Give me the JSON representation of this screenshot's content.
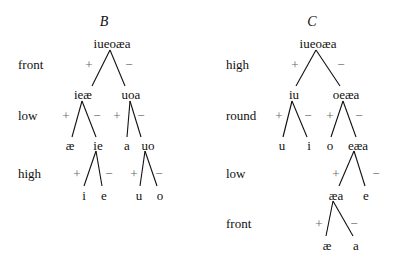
{
  "trees": [
    {
      "title": "B",
      "root": "iueoæa",
      "features": [
        "front",
        "low",
        "high"
      ],
      "nodes": {
        "l1_plus": "ieæ",
        "l1_minus": "uoa",
        "l2a_plus": "æ",
        "l2a_minus": "ie",
        "l2b_plus": "a",
        "l2b_minus": "uo",
        "l3a_plus": "i",
        "l3a_minus": "e",
        "l3b_plus": "u",
        "l3b_minus": "o"
      }
    },
    {
      "title": "C",
      "root": "iueoæa",
      "features": [
        "high",
        "round",
        "low",
        "front"
      ],
      "nodes": {
        "l1_plus": "iu",
        "l1_minus": "oeæa",
        "l2a_plus": "u",
        "l2a_minus": "i",
        "l2b_plus": "o",
        "l2b_minus": "eæa",
        "l3_plus": "æa",
        "l3_minus": "e",
        "l4_plus": "æ",
        "l4_minus": "a"
      }
    }
  ],
  "signs": {
    "plus": "+",
    "minus": "−"
  }
}
